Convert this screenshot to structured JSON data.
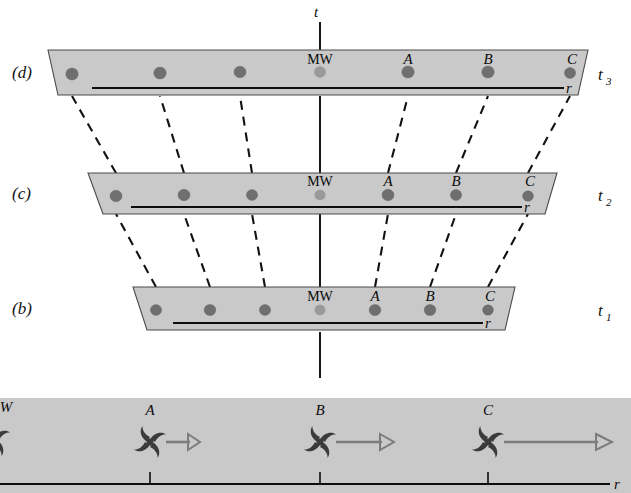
{
  "figure": {
    "type": "spacetime-expansion-diagram",
    "time_axis_label": "t",
    "distance_axis_label": "r"
  },
  "panels": [
    {
      "id": "d",
      "panel_label": "(d)",
      "time_label": "t3",
      "time_label_base": "t",
      "time_label_sub": "3",
      "distance_axis_label": "r",
      "galaxies": [
        {
          "name": "",
          "label_visible": false,
          "x": 72,
          "kind": "field"
        },
        {
          "name": "",
          "label_visible": false,
          "x": 160,
          "kind": "field"
        },
        {
          "name": "",
          "label_visible": false,
          "x": 240,
          "kind": "field"
        },
        {
          "name": "MW",
          "label_visible": true,
          "x": 320,
          "kind": "milky-way"
        },
        {
          "name": "A",
          "label_visible": true,
          "x": 408,
          "kind": "field"
        },
        {
          "name": "B",
          "label_visible": true,
          "x": 488,
          "kind": "field"
        },
        {
          "name": "C",
          "label_visible": true,
          "x": 570,
          "kind": "field"
        }
      ]
    },
    {
      "id": "c",
      "panel_label": "(c)",
      "time_label": "t2",
      "time_label_base": "t",
      "time_label_sub": "2",
      "distance_axis_label": "r",
      "galaxies": [
        {
          "name": "",
          "label_visible": false,
          "x": 116,
          "kind": "field"
        },
        {
          "name": "",
          "label_visible": false,
          "x": 184,
          "kind": "field"
        },
        {
          "name": "",
          "label_visible": false,
          "x": 252,
          "kind": "field"
        },
        {
          "name": "MW",
          "label_visible": true,
          "x": 320,
          "kind": "milky-way"
        },
        {
          "name": "A",
          "label_visible": true,
          "x": 388,
          "kind": "field"
        },
        {
          "name": "B",
          "label_visible": true,
          "x": 456,
          "kind": "field"
        },
        {
          "name": "C",
          "label_visible": true,
          "x": 528,
          "kind": "field"
        }
      ]
    },
    {
      "id": "b",
      "panel_label": "(b)",
      "time_label": "t1",
      "time_label_base": "t",
      "time_label_sub": "1",
      "distance_axis_label": "r",
      "galaxies": [
        {
          "name": "",
          "label_visible": false,
          "x": 156,
          "kind": "field"
        },
        {
          "name": "",
          "label_visible": false,
          "x": 210,
          "kind": "field"
        },
        {
          "name": "",
          "label_visible": false,
          "x": 265,
          "kind": "field"
        },
        {
          "name": "MW",
          "label_visible": true,
          "x": 320,
          "kind": "milky-way"
        },
        {
          "name": "A",
          "label_visible": true,
          "x": 375,
          "kind": "field"
        },
        {
          "name": "B",
          "label_visible": true,
          "x": 430,
          "kind": "field"
        },
        {
          "name": "C",
          "label_visible": true,
          "x": 488,
          "kind": "field"
        }
      ]
    }
  ],
  "bottom_panel": {
    "id": "a",
    "distance_axis_label": "r",
    "galaxies": [
      {
        "name": "W",
        "label_visible": true,
        "x": 4,
        "clipped": true,
        "has_arrow": false,
        "arrow_length": 0
      },
      {
        "name": "A",
        "label_visible": true,
        "x": 150,
        "clipped": false,
        "has_arrow": true,
        "arrow_length": 42
      },
      {
        "name": "B",
        "label_visible": true,
        "x": 320,
        "clipped": false,
        "has_arrow": true,
        "arrow_length": 78
      },
      {
        "name": "C",
        "label_visible": true,
        "x": 488,
        "clipped": false,
        "has_arrow": true,
        "arrow_length": 130
      }
    ],
    "tick_positions": [
      150,
      320,
      488
    ]
  },
  "colors": {
    "slab_fill": "#c9c9c9",
    "slab_edge": "#4a4a4a",
    "dot": "#6f6f6f",
    "dot_milky_way": "#9a9a9a",
    "ink": "#0d0d0d",
    "arrow": "#7c7c7c",
    "pinwheel": "#3b3b3b",
    "background": "#ffffff"
  }
}
